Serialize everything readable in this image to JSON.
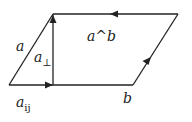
{
  "diagram": {
    "type": "parallelogram-vector-diagram",
    "stroke_color": "#222222",
    "labels": {
      "a": "a",
      "a_perp_base": "a",
      "a_perp_sub": "⊥",
      "wedge": "a^b",
      "a_par_base": "a",
      "a_par_sub": "ij",
      "b": "b"
    },
    "vertices": {
      "bottom_left": [
        9,
        85
      ],
      "bottom_right": [
        133,
        85
      ],
      "top_left": [
        53,
        14
      ],
      "top_right": [
        178,
        14
      ],
      "perp_foot": [
        53,
        85
      ]
    },
    "edges": [
      {
        "name": "a",
        "from": "bottom_left",
        "to": "top_left",
        "arrow": false
      },
      {
        "name": "a-parallel",
        "from": "bottom_left",
        "to": "perp_foot",
        "arrow": true
      },
      {
        "name": "b",
        "from": "perp_foot",
        "to": "bottom_right",
        "arrow": false
      },
      {
        "name": "right-side",
        "from": "bottom_right",
        "to": "top_right",
        "arrow": true
      },
      {
        "name": "top-side",
        "from": "top_right",
        "to": "top_left",
        "arrow": true
      },
      {
        "name": "a-perp",
        "from": "perp_foot",
        "to": "top_left",
        "arrow": true
      }
    ]
  }
}
